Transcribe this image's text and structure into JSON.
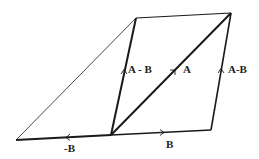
{
  "diagram": {
    "background": "#ffffff",
    "stroke_color": "#1a1a1a",
    "points": {
      "far_left": [
        16,
        140
      ],
      "origin": [
        111,
        135
      ],
      "bottom_right": [
        211,
        130
      ],
      "top_left": [
        136,
        18
      ],
      "top_right": [
        231,
        13
      ]
    },
    "labels": {
      "a_minus_b_left": "A - B",
      "a": "A",
      "a_minus_b_right": "A-B",
      "minus_b": "-B",
      "b": "B"
    }
  }
}
